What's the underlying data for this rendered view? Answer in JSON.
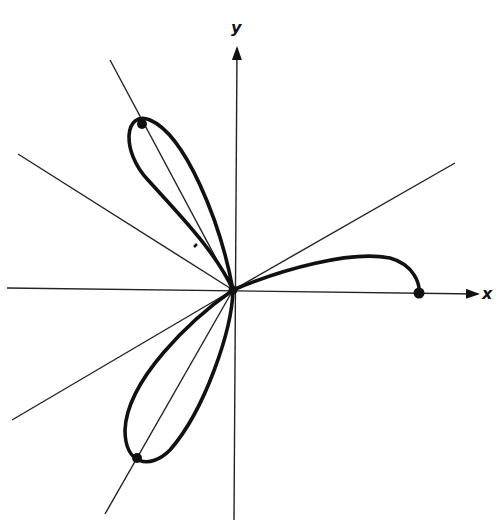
{
  "diagram": {
    "type": "polar-curve",
    "axes": {
      "x_label": "x",
      "y_label": "y"
    },
    "colors": {
      "ink": "#111111",
      "background": "#ffffff"
    },
    "markers": [
      {
        "name": "upper-petal-tip",
        "x": 142,
        "y": 124
      },
      {
        "name": "lower-petal-tip",
        "x": 137,
        "y": 458
      },
      {
        "name": "curve-endpoint-on-x-axis",
        "x": 419,
        "y": 293
      },
      {
        "name": "origin",
        "x": 233,
        "y": 290
      }
    ]
  }
}
